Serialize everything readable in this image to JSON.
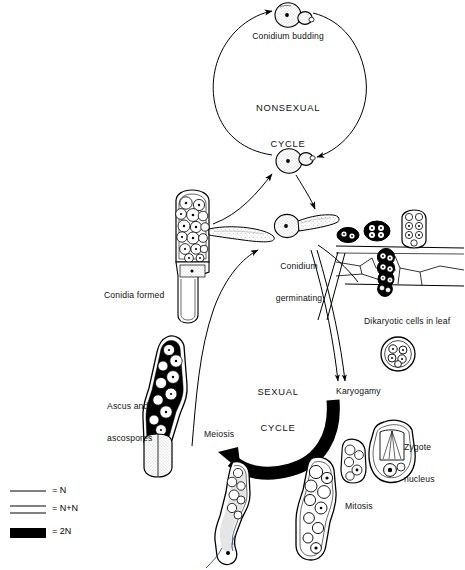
{
  "figure": {
    "kind": "fungal-life-cycle-diagram",
    "background": "#ffffff",
    "ink": "#000000"
  },
  "cycles": {
    "nonsexual": {
      "line1": "NONSEXUAL",
      "line2": "CYCLE"
    },
    "sexual": {
      "line1": "SEXUAL",
      "line2": "CYCLE"
    }
  },
  "labels": {
    "conidium_budding": "Conidium budding",
    "conidium_germ_l1": "Conidium",
    "conidium_germ_l2": "germinating",
    "conidia_formed": "Conidia formed",
    "ascus_l1": "Ascus and",
    "ascus_l2": "ascospores",
    "meiosis": "Meiosis",
    "mitosis": "Mitosis",
    "karyogamy": "Karyogamy",
    "zygote_l1": "Zygote",
    "zygote_l2": "nucleus",
    "dikaryotic": "Dikaryotic cells in leaf"
  },
  "legend": {
    "items": [
      {
        "key": "n",
        "swatch": "single-thin-line",
        "text": "= N"
      },
      {
        "key": "nn",
        "swatch": "double-thin-line",
        "text": "= N+N"
      },
      {
        "key": "2n",
        "swatch": "solid-black-bar",
        "text": "= 2N"
      }
    ]
  },
  "structures": {
    "conidium_budding_cell": "stippled round conidium with small bud",
    "conidium_center_cell": "stippled round conidium with bud",
    "conidium_germ_cell": "round conidium with germ tube",
    "conidiophore": "club cell packed with conidia",
    "ascus": "elongate ascus containing ascospores",
    "meiosis_cell": "elongate cell after meiosis",
    "mitosis_cell": "club cell with dividing nuclei",
    "zygote_cell": "cell with zygote nucleus and spindle",
    "leaf_tissue": "leaf cells with dikaryotic cells",
    "spore_chain": "three spores on leaf surface",
    "rounded_cell": "encysted rounded cell"
  }
}
